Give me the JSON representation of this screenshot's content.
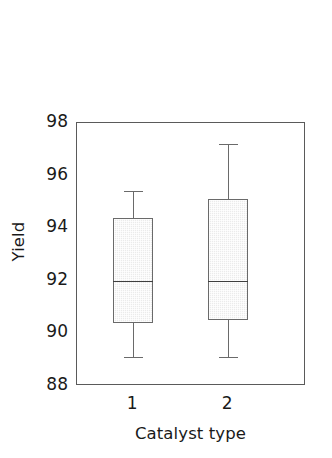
{
  "chart_data": {
    "type": "box",
    "title": "",
    "xlabel": "Catalyst type",
    "ylabel": "Yield",
    "categories": [
      "1",
      "2"
    ],
    "ylim": [
      88,
      98
    ],
    "yticks": [
      88,
      90,
      92,
      94,
      96,
      98
    ],
    "ytick_labels": [
      "88",
      "90",
      "92",
      "94",
      "96",
      "98"
    ],
    "xtick_labels": [
      "1",
      "2"
    ],
    "grid": false,
    "legend": null,
    "box_fill_color": "#ebebeb",
    "box_line_color": "#6a6a6a",
    "median_line_color": "#3f3f3f",
    "axis_color": "#5a5a5a",
    "boxes": [
      {
        "category": "1",
        "whisker_low": 89.1,
        "q1": 90.4,
        "median": 92.0,
        "q3": 94.4,
        "whisker_high": 95.4
      },
      {
        "category": "2",
        "whisker_low": 89.1,
        "q1": 90.5,
        "median": 92.0,
        "q3": 95.1,
        "whisker_high": 97.2
      }
    ]
  }
}
